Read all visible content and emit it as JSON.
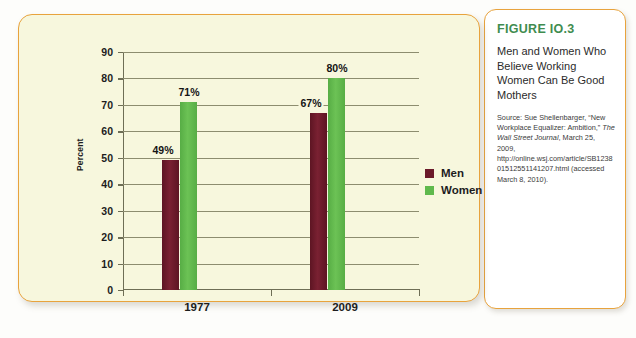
{
  "figure": {
    "number_label": "FIGURE IO.3",
    "title": "Men and Women Who Believe Working Women Can Be Good Mothers",
    "source_prefix": "Source: Sue Shellenbarger, “New Workplace Equalizer: Ambition,” ",
    "source_italic": "The Wall Street Journal",
    "source_suffix": ", March 25, 2009, http://online.wsj.com/article/SB123801512551141207.html (accessed March 8, 2010)."
  },
  "colors": {
    "men_bar": "#6b1a2a",
    "women_bar": "#5fb94c",
    "panel_background": "#f7f7dd",
    "panel_border": "#e8a33d",
    "figure_number": "#3f8c4f",
    "gridline": "#8d8d6f"
  },
  "chart_data": {
    "type": "bar",
    "title": "Men and Women Who Believe Working Women Can Be Good Mothers",
    "xlabel": "",
    "ylabel": "Percent",
    "categories": [
      "1977",
      "2009"
    ],
    "series": [
      {
        "name": "Men",
        "values": [
          49,
          67
        ],
        "color": "#6b1a2a",
        "labels": [
          "49%",
          "67%"
        ]
      },
      {
        "name": "Women",
        "values": [
          71,
          80
        ],
        "color": "#5fb94c",
        "labels": [
          "71%",
          "80%"
        ]
      }
    ],
    "ylim": [
      0,
      90
    ],
    "yticks": [
      0,
      10,
      20,
      30,
      40,
      50,
      60,
      70,
      80,
      90
    ],
    "ytick_labels": [
      "0",
      "10",
      "20",
      "30",
      "40",
      "50",
      "60",
      "70",
      "80",
      "90"
    ],
    "grid": true,
    "grid_axis": "y",
    "legend_position": "right"
  }
}
